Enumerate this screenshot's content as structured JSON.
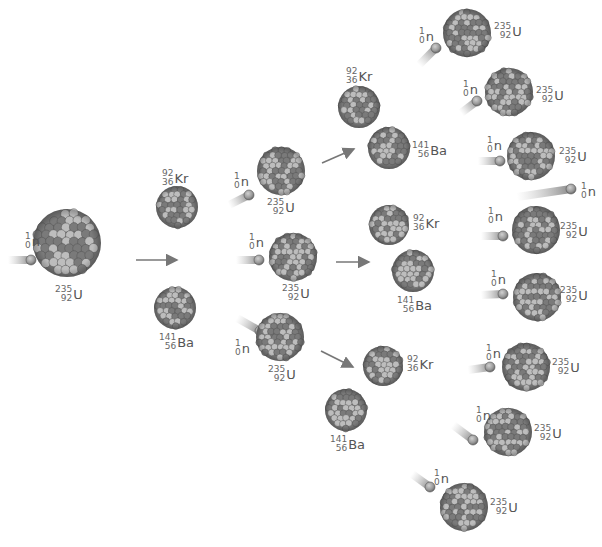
{
  "colors": {
    "background": "#ffffff",
    "nucleus_dark": "#6b6b6b",
    "nucleus_light": "#b4b4b4",
    "arrow": "#777777",
    "text": "#555555"
  },
  "nuclei": [
    {
      "id": "u0",
      "type": "U-235",
      "cx": 67,
      "cy": 243,
      "r": 34
    },
    {
      "id": "kr1",
      "type": "Kr-92",
      "cx": 177,
      "cy": 207,
      "r": 21
    },
    {
      "id": "ba1",
      "type": "Ba-141",
      "cx": 175,
      "cy": 308,
      "r": 21
    },
    {
      "id": "u1a",
      "type": "U-235",
      "cx": 281,
      "cy": 171,
      "r": 24
    },
    {
      "id": "u1b",
      "type": "U-235",
      "cx": 293,
      "cy": 257,
      "r": 24
    },
    {
      "id": "u1c",
      "type": "U-235",
      "cx": 280,
      "cy": 337,
      "r": 24
    },
    {
      "id": "kr2a",
      "type": "Kr-92",
      "cx": 359,
      "cy": 107,
      "r": 21
    },
    {
      "id": "ba2a",
      "type": "Ba-141",
      "cx": 389,
      "cy": 148,
      "r": 21
    },
    {
      "id": "kr2b",
      "type": "Kr-92",
      "cx": 389,
      "cy": 225,
      "r": 20
    },
    {
      "id": "ba2b",
      "type": "Ba-141",
      "cx": 413,
      "cy": 271,
      "r": 21
    },
    {
      "id": "kr2c",
      "type": "Kr-92",
      "cx": 383,
      "cy": 366,
      "r": 20
    },
    {
      "id": "ba2c",
      "type": "Ba-141",
      "cx": 346,
      "cy": 410,
      "r": 21
    },
    {
      "id": "u3a",
      "type": "U-235",
      "cx": 467,
      "cy": 33,
      "r": 24
    },
    {
      "id": "u3b",
      "type": "U-235",
      "cx": 509,
      "cy": 92,
      "r": 24
    },
    {
      "id": "u3c",
      "type": "U-235",
      "cx": 531,
      "cy": 156,
      "r": 24
    },
    {
      "id": "u3d",
      "type": "U-235",
      "cx": 536,
      "cy": 230,
      "r": 24
    },
    {
      "id": "u3e",
      "type": "U-235",
      "cx": 537,
      "cy": 297,
      "r": 24
    },
    {
      "id": "u3f",
      "type": "U-235",
      "cx": 526,
      "cy": 367,
      "r": 24
    },
    {
      "id": "u3g",
      "type": "U-235",
      "cx": 508,
      "cy": 432,
      "r": 24
    },
    {
      "id": "u3h",
      "type": "U-235",
      "cx": 464,
      "cy": 507,
      "r": 24
    }
  ],
  "neutrons": [
    {
      "id": "n0",
      "x1": 8,
      "y1": 260,
      "x2": 31,
      "y2": 260
    },
    {
      "id": "n1a",
      "x1": 229,
      "y1": 205,
      "x2": 249,
      "y2": 195
    },
    {
      "id": "n1b",
      "x1": 236,
      "y1": 260,
      "x2": 259,
      "y2": 260
    },
    {
      "id": "n1c",
      "x1": 237,
      "y1": 318,
      "x2": 260,
      "y2": 331
    },
    {
      "id": "n3a",
      "x1": 419,
      "y1": 65,
      "x2": 436,
      "y2": 48
    },
    {
      "id": "n3b",
      "x1": 461,
      "y1": 113,
      "x2": 477,
      "y2": 101
    },
    {
      "id": "n3c",
      "x1": 478,
      "y1": 161,
      "x2": 500,
      "y2": 161
    },
    {
      "id": "n3d",
      "x1": 517,
      "y1": 197,
      "x2": 571,
      "y2": 189
    },
    {
      "id": "n3e",
      "x1": 481,
      "y1": 236,
      "x2": 503,
      "y2": 236
    },
    {
      "id": "n3f",
      "x1": 481,
      "y1": 295,
      "x2": 503,
      "y2": 294
    },
    {
      "id": "n3g",
      "x1": 468,
      "y1": 370,
      "x2": 490,
      "y2": 367
    },
    {
      "id": "n3h",
      "x1": 453,
      "y1": 425,
      "x2": 473,
      "y2": 440
    },
    {
      "id": "n3i",
      "x1": 412,
      "y1": 474,
      "x2": 430,
      "y2": 487
    }
  ],
  "arrows": [
    {
      "id": "a0",
      "x1": 136,
      "y1": 260,
      "x2": 177,
      "y2": 260
    },
    {
      "id": "a1",
      "x1": 322,
      "y1": 163,
      "x2": 354,
      "y2": 149
    },
    {
      "id": "a2",
      "x1": 336,
      "y1": 262,
      "x2": 369,
      "y2": 262
    },
    {
      "id": "a3",
      "x1": 321,
      "y1": 351,
      "x2": 353,
      "y2": 367
    }
  ],
  "labels": [
    {
      "id": "l-n0",
      "mass": "1",
      "atomic": "0",
      "symbol": "n",
      "x": 25,
      "y": 232
    },
    {
      "id": "l-u0",
      "mass": "235",
      "atomic": "92",
      "symbol": "U",
      "x": 55,
      "y": 285
    },
    {
      "id": "l-kr1",
      "mass": "92",
      "atomic": "36",
      "symbol": "Kr",
      "x": 162,
      "y": 169
    },
    {
      "id": "l-ba1",
      "mass": "141",
      "atomic": "56",
      "symbol": "Ba",
      "x": 159,
      "y": 333
    },
    {
      "id": "l-n1a",
      "mass": "1",
      "atomic": "0",
      "symbol": "n",
      "x": 234,
      "y": 172
    },
    {
      "id": "l-u1a",
      "mass": "235",
      "atomic": "92",
      "symbol": "U",
      "x": 267,
      "y": 198
    },
    {
      "id": "l-n1b",
      "mass": "1",
      "atomic": "0",
      "symbol": "n",
      "x": 249,
      "y": 233
    },
    {
      "id": "l-u1b",
      "mass": "235",
      "atomic": "92",
      "symbol": "U",
      "x": 282,
      "y": 284
    },
    {
      "id": "l-n1c",
      "mass": "1",
      "atomic": "0",
      "symbol": "n",
      "x": 235,
      "y": 339
    },
    {
      "id": "l-u1c",
      "mass": "235",
      "atomic": "92",
      "symbol": "U",
      "x": 268,
      "y": 365
    },
    {
      "id": "l-kr2a",
      "mass": "92",
      "atomic": "36",
      "symbol": "Kr",
      "x": 346,
      "y": 67
    },
    {
      "id": "l-ba2a",
      "mass": "141",
      "atomic": "56",
      "symbol": "Ba",
      "x": 412,
      "y": 141
    },
    {
      "id": "l-kr2b",
      "mass": "92",
      "atomic": "36",
      "symbol": "Kr",
      "x": 413,
      "y": 214
    },
    {
      "id": "l-ba2b",
      "mass": "141",
      "atomic": "56",
      "symbol": "Ba",
      "x": 397,
      "y": 296
    },
    {
      "id": "l-kr2c",
      "mass": "92",
      "atomic": "36",
      "symbol": "Kr",
      "x": 407,
      "y": 355
    },
    {
      "id": "l-ba2c",
      "mass": "141",
      "atomic": "56",
      "symbol": "Ba",
      "x": 330,
      "y": 435
    },
    {
      "id": "l-n3a",
      "mass": "1",
      "atomic": "0",
      "symbol": "n",
      "x": 419,
      "y": 27
    },
    {
      "id": "l-u3a",
      "mass": "235",
      "atomic": "92",
      "symbol": "U",
      "x": 494,
      "y": 22
    },
    {
      "id": "l-n3b",
      "mass": "1",
      "atomic": "0",
      "symbol": "n",
      "x": 463,
      "y": 80
    },
    {
      "id": "l-u3b",
      "mass": "235",
      "atomic": "92",
      "symbol": "U",
      "x": 536,
      "y": 86
    },
    {
      "id": "l-n3c",
      "mass": "1",
      "atomic": "0",
      "symbol": "n",
      "x": 487,
      "y": 136
    },
    {
      "id": "l-u3c",
      "mass": "235",
      "atomic": "92",
      "symbol": "U",
      "x": 559,
      "y": 147
    },
    {
      "id": "l-n3d",
      "mass": "1",
      "atomic": "0",
      "symbol": "n",
      "x": 581,
      "y": 182
    },
    {
      "id": "l-n3e",
      "mass": "1",
      "atomic": "0",
      "symbol": "n",
      "x": 488,
      "y": 207
    },
    {
      "id": "l-u3e",
      "mass": "235",
      "atomic": "92",
      "symbol": "U",
      "x": 560,
      "y": 222
    },
    {
      "id": "l-n3f",
      "mass": "1",
      "atomic": "0",
      "symbol": "n",
      "x": 491,
      "y": 270
    },
    {
      "id": "l-u3f",
      "mass": "235",
      "atomic": "92",
      "symbol": "U",
      "x": 560,
      "y": 286
    },
    {
      "id": "l-n3g",
      "mass": "1",
      "atomic": "0",
      "symbol": "n",
      "x": 486,
      "y": 344
    },
    {
      "id": "l-u3g",
      "mass": "235",
      "atomic": "92",
      "symbol": "U",
      "x": 552,
      "y": 358
    },
    {
      "id": "l-n3h",
      "mass": "1",
      "atomic": "0",
      "symbol": "n",
      "x": 476,
      "y": 406
    },
    {
      "id": "l-u3h",
      "mass": "235",
      "atomic": "92",
      "symbol": "U",
      "x": 534,
      "y": 424
    },
    {
      "id": "l-n3i",
      "mass": "1",
      "atomic": "0",
      "symbol": "n",
      "x": 434,
      "y": 469
    },
    {
      "id": "l-u3i",
      "mass": "235",
      "atomic": "92",
      "symbol": "U",
      "x": 490,
      "y": 498
    }
  ]
}
